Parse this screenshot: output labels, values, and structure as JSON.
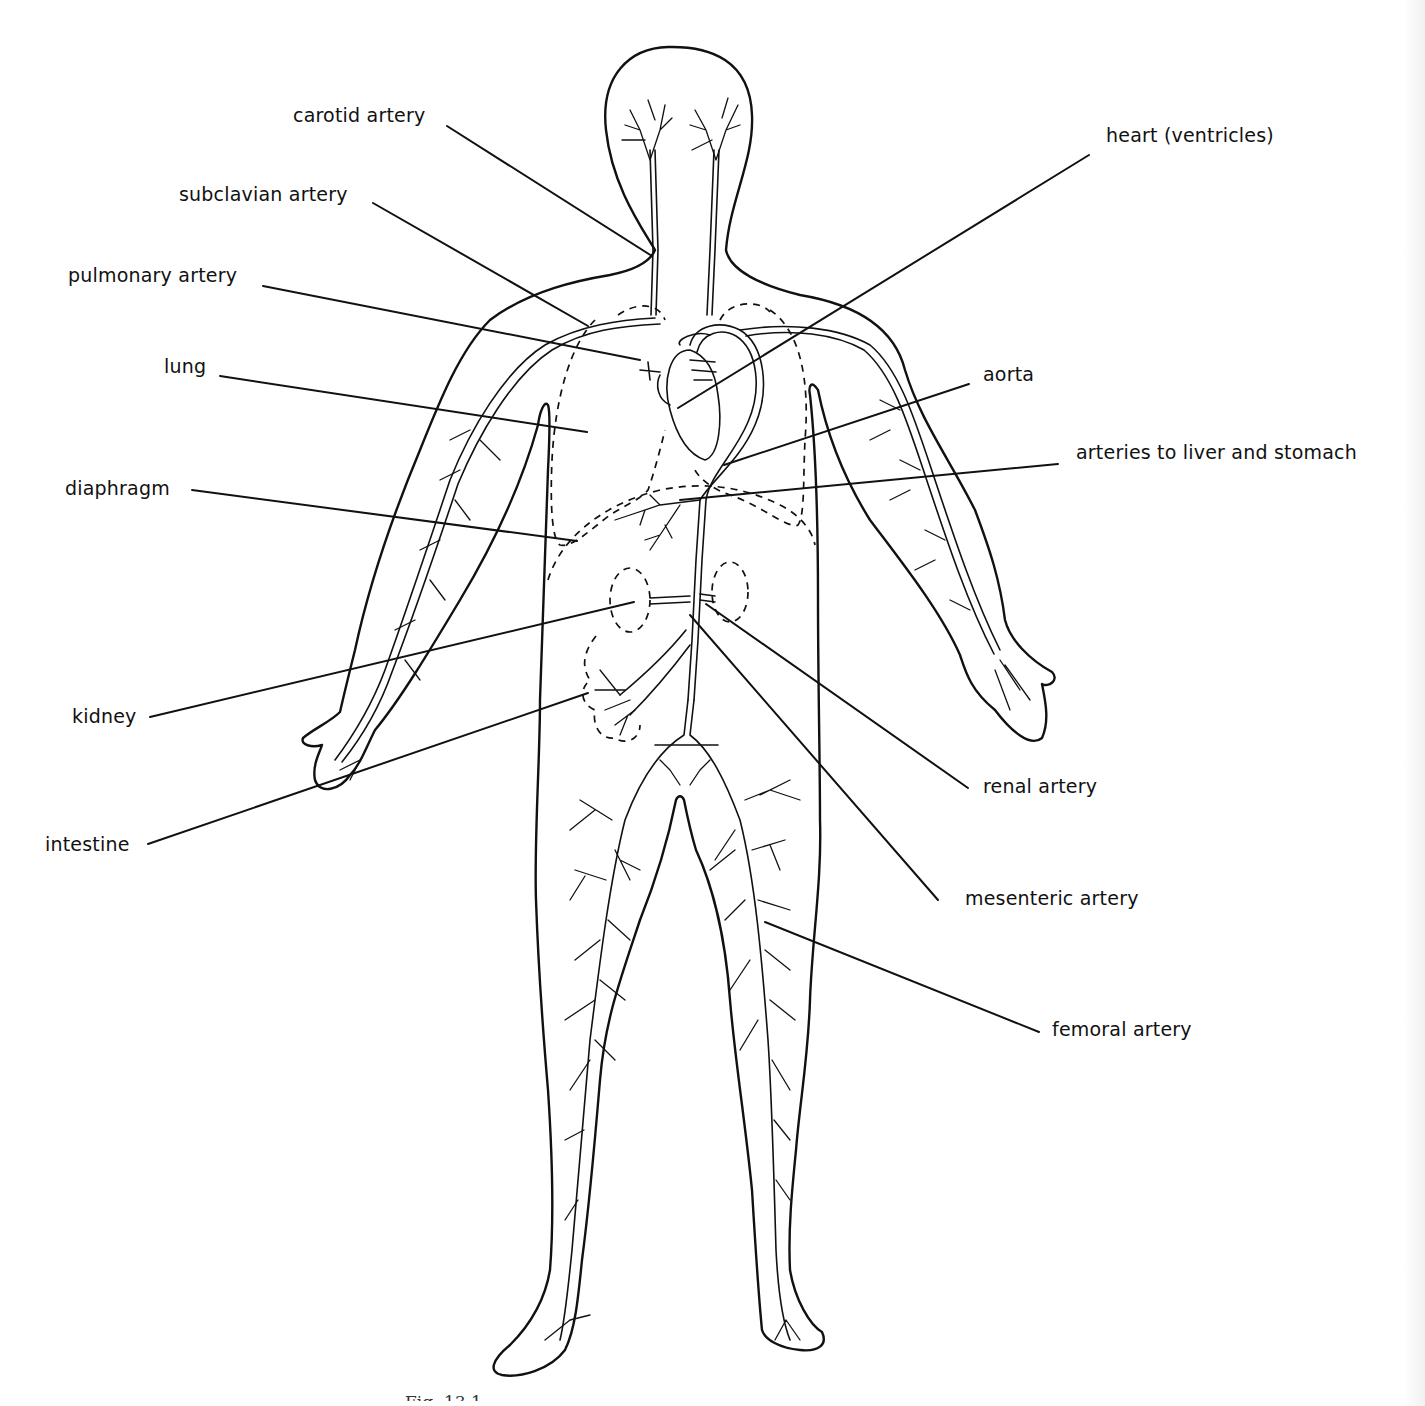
{
  "figure": {
    "caption_partial": "Fig. 13.1",
    "line_color": "#111111",
    "background": "#ffffff"
  },
  "labels": {
    "carotid_artery": "carotid artery",
    "subclavian_artery": "subclavian artery",
    "pulmonary_artery": "pulmonary artery",
    "lung": "lung",
    "diaphragm": "diaphragm",
    "kidney": "kidney",
    "intestine": "intestine",
    "heart": "heart (ventricles)",
    "aorta": "aorta",
    "liver_stomach": "arteries to liver and stomach",
    "renal_artery": "renal artery",
    "mesenteric_artery": "mesenteric artery",
    "femoral_artery": "femoral artery"
  }
}
